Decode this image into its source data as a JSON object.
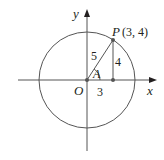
{
  "diagram": {
    "type": "unit-circle-trig",
    "axes": {
      "x_label": "x",
      "y_label": "y",
      "origin_label": "O"
    },
    "circle": {
      "radius_units": 5
    },
    "point": {
      "name": "P",
      "coords_text": "(3, 4)",
      "x": 3,
      "y": 4
    },
    "segments": {
      "hypotenuse_label": "5",
      "vertical_label": "4",
      "horizontal_label": "3"
    },
    "angle_label": "A",
    "colors": {
      "line": "#555555",
      "text": "#231f20",
      "point": "#555555"
    }
  }
}
